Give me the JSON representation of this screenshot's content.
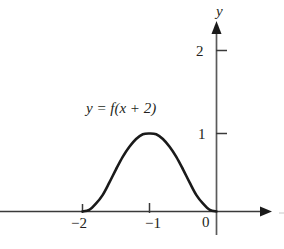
{
  "figure": {
    "background_color": "#ffffff",
    "ink_color": "#231f20",
    "curve_label": "y = f(x + 2)",
    "y_axis_name": "y"
  },
  "chart_data": {
    "type": "line",
    "title": "",
    "subtitle": "",
    "xlabel": "",
    "ylabel": "y",
    "annotations": [
      {
        "text": "y = f(x + 2)",
        "x": -1.35,
        "y": 1.55
      }
    ],
    "grid": false,
    "legend": null,
    "xlim": [
      -2.9,
      0.5
    ],
    "ylim": [
      -0.25,
      2.45
    ],
    "x_ticks": [
      -2,
      -1,
      0
    ],
    "x_tick_labels": [
      "−2",
      "−1",
      "0"
    ],
    "y_ticks": [
      1,
      2
    ],
    "y_tick_labels": [
      "1",
      "2"
    ],
    "axes_arrows": [
      "x-positive",
      "y-positive"
    ],
    "series": [
      {
        "name": "y = f(x + 2)",
        "description": "smooth bell-shaped bump, zero outside [-2, 0], peak value 1 at x = -1, tangent to x-axis at both endpoints",
        "line_color": "#1a1a1a",
        "line_width": 2.6,
        "x": [
          -2.0,
          -1.9,
          -1.8,
          -1.7,
          -1.6,
          -1.5,
          -1.4,
          -1.3,
          -1.2,
          -1.1,
          -1.0,
          -0.9,
          -0.8,
          -0.7,
          -0.6,
          -0.5,
          -0.4,
          -0.3,
          -0.2,
          -0.1,
          0.0
        ],
        "y": [
          0.0,
          0.02,
          0.1,
          0.21,
          0.37,
          0.54,
          0.7,
          0.83,
          0.93,
          0.99,
          1.0,
          0.99,
          0.93,
          0.83,
          0.7,
          0.54,
          0.37,
          0.21,
          0.1,
          0.02,
          0.0
        ]
      }
    ]
  },
  "labels": {
    "y_axis": "y",
    "tick_2": "2",
    "tick_1": "1",
    "tick_0": "0",
    "tick_neg2": "−2",
    "tick_neg1": "−1",
    "equation": "y = f(x + 2)"
  }
}
